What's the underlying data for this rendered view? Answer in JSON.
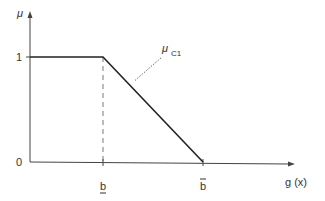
{
  "chart_data": {
    "type": "line",
    "title": "",
    "xlabel": "g (x)",
    "ylabel": "μ",
    "x_ticks": [
      {
        "label": "b",
        "mark": "underline",
        "value": 1
      },
      {
        "label": "b",
        "mark": "overline",
        "value": 2
      }
    ],
    "y_ticks": [
      {
        "label": "0",
        "value": 0
      },
      {
        "label": "1",
        "value": 1
      }
    ],
    "xlim": [
      0,
      2.7
    ],
    "ylim": [
      0,
      1.45
    ],
    "series": [
      {
        "name": "μ_C1",
        "points": [
          [
            0,
            1
          ],
          [
            1,
            1
          ],
          [
            2,
            0
          ]
        ]
      }
    ],
    "guides": [
      {
        "type": "vertical-dashed",
        "x": 1,
        "from": 0,
        "to": 1
      }
    ],
    "annotations": [
      {
        "text": "μ",
        "subscript": "C1",
        "points_to": [
          1.3,
          0.7
        ]
      }
    ],
    "grid": false,
    "legend": "none"
  }
}
